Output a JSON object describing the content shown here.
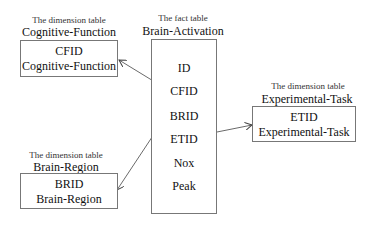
{
  "diagram": {
    "fact_table": {
      "caption": "The fact table",
      "name": "Brain-Activation",
      "fields": [
        "ID",
        "CFID",
        "BRID",
        "ETID",
        "Nox",
        "Peak"
      ]
    },
    "dimension_tables": [
      {
        "id": "cognitive-function",
        "caption": "The dimension table",
        "name": "Cognitive-Function",
        "fields": [
          "CFID",
          "Cognitive-Function"
        ]
      },
      {
        "id": "experimental-task",
        "caption": "The dimension table",
        "name": "Experimental-Task",
        "fields": [
          "ETID",
          "Experimental-Task"
        ]
      },
      {
        "id": "brain-region",
        "caption": "The dimension table",
        "name": "Brain-Region",
        "fields": [
          "BRID",
          "Brain-Region"
        ]
      }
    ],
    "relationships": [
      {
        "from": "CFID",
        "to": "Cognitive-Function"
      },
      {
        "from": "BRID",
        "to": "Brain-Region"
      },
      {
        "from": "ETID",
        "to": "Experimental-Task"
      }
    ]
  }
}
